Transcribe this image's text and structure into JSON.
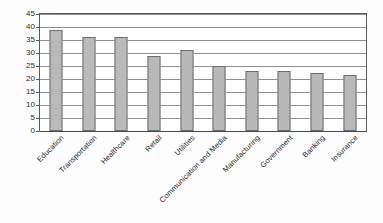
{
  "chart_data": {
    "type": "bar",
    "title": "",
    "subtitle": "",
    "xlabel": "",
    "ylabel": "",
    "ylim": [
      0,
      45
    ],
    "ytick_step": 5,
    "yticks": [
      45,
      40,
      35,
      30,
      25,
      20,
      15,
      10,
      5,
      0
    ],
    "grid": true,
    "legend": false,
    "legend_position": "none",
    "orientation": "vertical",
    "categories": [
      "Education",
      "Transportation",
      "Healthcare",
      "Retail",
      "Utilities",
      "Communication and Media",
      "Manufacturing",
      "Government",
      "Banking",
      "Insurance"
    ],
    "values": [
      39,
      36,
      36,
      29,
      31,
      25,
      23,
      23,
      22.3,
      21.5
    ],
    "series": [
      {
        "name": "",
        "values": [
          39,
          36,
          36,
          29,
          31,
          25,
          23,
          23,
          22.3,
          21.5
        ]
      }
    ],
    "annotations": []
  },
  "style": {
    "bar_fill": "#b9b9b9",
    "bar_border": "#6e6e6e",
    "gridline_color": "#8f8f8f",
    "axis_color": "#5a5a5a",
    "plot_background": "#ffffff",
    "canvas_background": "#fdfdfd",
    "text_color": "#1f1f1f"
  }
}
